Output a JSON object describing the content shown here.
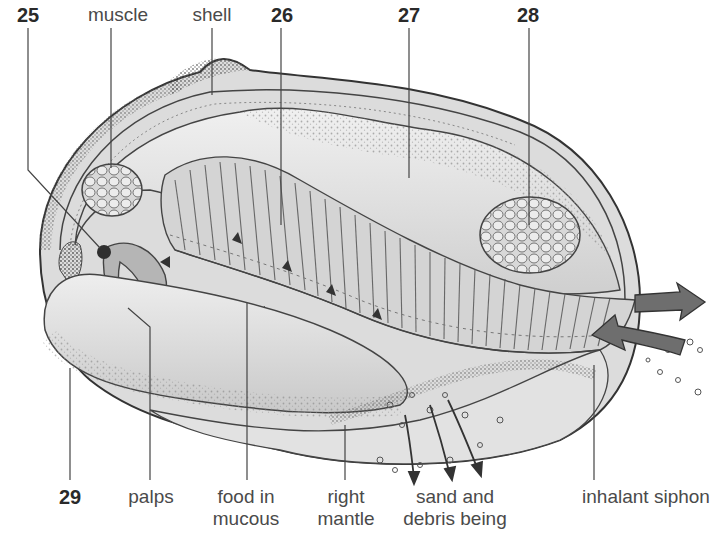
{
  "diagram": {
    "colors": {
      "ink": "#3a3a3a",
      "shade_dark": "#8a8a8a",
      "shade_mid": "#bdbdbd",
      "shade_light": "#e4e4e4",
      "arrow_fill": "#6e6e6e",
      "background": "#ffffff"
    },
    "labels_top": [
      {
        "id": "25",
        "text": "25",
        "bold": true,
        "x": 28,
        "y": 6
      },
      {
        "id": "muscle",
        "text": "muscle",
        "bold": false,
        "x": 118,
        "y": 6
      },
      {
        "id": "shell",
        "text": "shell",
        "bold": false,
        "x": 212,
        "y": 6
      },
      {
        "id": "26",
        "text": "26",
        "bold": true,
        "x": 282,
        "y": 6
      },
      {
        "id": "27",
        "text": "27",
        "bold": true,
        "x": 409,
        "y": 6
      },
      {
        "id": "28",
        "text": "28",
        "bold": true,
        "x": 528,
        "y": 6
      }
    ],
    "labels_bottom": [
      {
        "id": "29",
        "text": "29",
        "bold": true,
        "x": 70,
        "y": 486
      },
      {
        "id": "palps",
        "text": "palps",
        "bold": false,
        "x": 151,
        "y": 486
      },
      {
        "id": "food-in-mucous",
        "line1": "food in",
        "line2": "mucous",
        "x": 246,
        "y": 486
      },
      {
        "id": "right-mantle",
        "line1": "right",
        "line2": "mantle",
        "x": 346,
        "y": 486
      },
      {
        "id": "sand-and-debris",
        "line1": "sand and",
        "line2": "debris being",
        "x": 455,
        "y": 486
      },
      {
        "id": "inhalant-siphon",
        "text": "inhalant siphon",
        "bold": false,
        "x": 646,
        "y": 486
      }
    ],
    "flow_arrows": [
      {
        "name": "exhalant-flow",
        "direction": "out-right"
      },
      {
        "name": "inhalant-flow",
        "direction": "in-left"
      }
    ]
  }
}
